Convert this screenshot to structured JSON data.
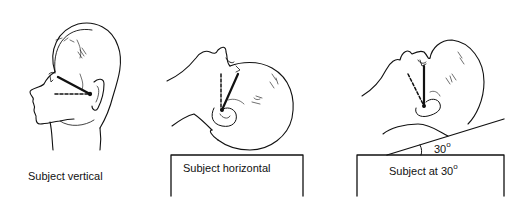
{
  "panels": [
    {
      "id": "vertical",
      "label": "Subject vertical",
      "posture": "upright"
    },
    {
      "id": "horizontal",
      "label": "Subject horizontal",
      "posture": "supine"
    },
    {
      "id": "thirty",
      "label_prefix": "Subject at 30",
      "label_suffix": "o",
      "posture": "reclined 30 degrees"
    }
  ],
  "angle_annotation": {
    "value": "30",
    "unit_glyph": "o"
  },
  "legend": {
    "solid_line": "solid reference line",
    "dashed_line": "dashed reference line"
  },
  "colors": {
    "ink": "#111111",
    "background": "#ffffff"
  }
}
